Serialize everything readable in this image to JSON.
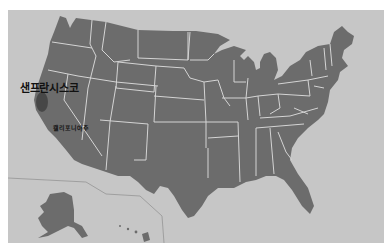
{
  "map": {
    "region": "United States",
    "colors": {
      "background": "#c6c6c6",
      "state_fill": "#6c6c6c",
      "state_border": "#d4d4d4",
      "highlight": "#4a4a4a",
      "inset_border": "#8e8e8e"
    },
    "labels": {
      "city": "샌프란시스코",
      "state": "캘리포니아주"
    },
    "insets": [
      "Alaska",
      "Hawaii"
    ]
  }
}
